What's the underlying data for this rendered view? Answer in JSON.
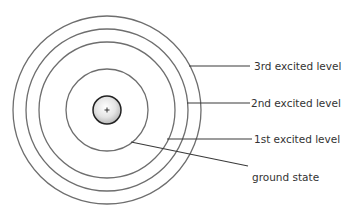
{
  "diagram": {
    "nucleus": {
      "symbol": "+",
      "cx": 107,
      "cy": 110,
      "r": 14
    },
    "levels": [
      {
        "name": "ground state",
        "r": 41
      },
      {
        "name": "1st excited level",
        "r": 68
      },
      {
        "name": "2nd excited level",
        "r": 81
      },
      {
        "name": "3rd excited level",
        "r": 94
      }
    ],
    "labels": {
      "third": "3rd excited level",
      "second": "2nd excited level",
      "first": "1st excited level",
      "ground": "ground state"
    },
    "colors": {
      "ring": "#6e6e6e",
      "leader": "#3a3a3a",
      "text": "#333333"
    }
  }
}
